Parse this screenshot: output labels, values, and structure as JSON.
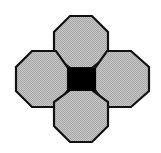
{
  "figure": {
    "name": "octagon-square-tiling-motif",
    "canvas": {
      "width": 161,
      "height": 153
    },
    "background_color": "#ffffff"
  },
  "style": {
    "octagon_fill": "#b8b8b8",
    "octagon_stroke": "#111111",
    "octagon_stroke_width": 2.2,
    "center_square_fill": "#000000",
    "center_square_stroke": "#000000",
    "center_square_stroke_width": 1,
    "dither_light": "#c8c8c8",
    "dither_dark": "#a6a6a6"
  },
  "geometry": {
    "center_square": {
      "x": 68,
      "y": 68,
      "width": 27,
      "height": 23
    },
    "octagon_size": 56,
    "octagon_chamfer": 11,
    "bounds": {
      "left": 16,
      "top": 16,
      "right": 149,
      "bottom": 142
    }
  },
  "shapes": {
    "octagons": [
      {
        "id": "octagon-top",
        "label": "Top octagon",
        "center": {
          "x": 81,
          "y": 44
        },
        "points": "70,16 92,16 108,32 108,56 92,68 70,68 54,56 54,32"
      },
      {
        "id": "octagon-left",
        "label": "Left octagon",
        "center": {
          "x": 44,
          "y": 79
        },
        "points": "32,51 56,51 68,68 68,90 56,107 32,107 16,91 16,67"
      },
      {
        "id": "octagon-right",
        "label": "Right octagon",
        "center": {
          "x": 119,
          "y": 79
        },
        "points": "107,51 131,51 149,67 149,91 131,107 107,107 95,90 95,68"
      },
      {
        "id": "octagon-bottom",
        "label": "Bottom octagon",
        "center": {
          "x": 81,
          "y": 114
        },
        "points": "70,90 92,90 108,102 108,126 92,142 70,142 54,126 54,102"
      }
    ],
    "center_square": {
      "id": "center-square",
      "label": "Center square",
      "points": "68,68 95,68 95,90 68,90"
    }
  }
}
